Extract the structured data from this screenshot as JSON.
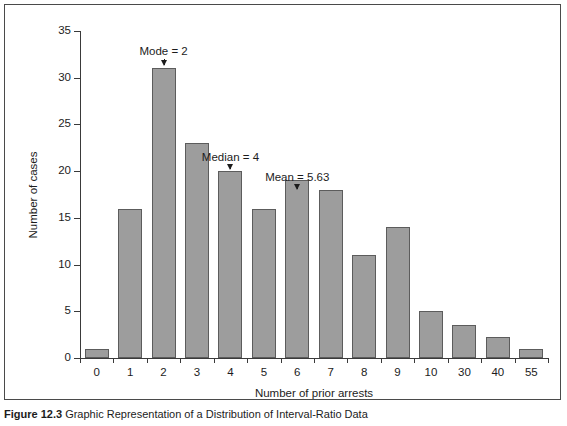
{
  "chart_data": {
    "type": "bar",
    "title": "",
    "xlabel": "Number of prior arrests",
    "ylabel": "Number of cases",
    "categories": [
      "0",
      "1",
      "2",
      "3",
      "4",
      "5",
      "6",
      "7",
      "8",
      "9",
      "10",
      "30",
      "40",
      "55"
    ],
    "values": [
      1,
      16,
      31,
      23,
      20,
      16,
      19,
      18,
      11,
      14,
      5,
      3.5,
      2.3,
      1
    ],
    "ylim": [
      0,
      35
    ],
    "yticks": [
      0,
      5,
      10,
      15,
      20,
      25,
      30,
      35
    ],
    "ytick_labels": [
      "0",
      "5",
      "10",
      "15",
      "20",
      "25",
      "30",
      "35"
    ],
    "grid": false,
    "legend": "none",
    "bar_fill_color": "#9d9d9d",
    "bar_edge_color": "#5c5c5c",
    "annotations": [
      {
        "label": "Mode = 2",
        "category": "2",
        "value": 31
      },
      {
        "label": "Median = 4",
        "category": "4",
        "value": 20
      },
      {
        "label": "Mean = 5.63",
        "category": "6",
        "value": 19
      }
    ]
  },
  "caption": {
    "label": "Figure 12.3",
    "text": "Graphic Representation of a Distribution of Interval-Ratio Data"
  }
}
